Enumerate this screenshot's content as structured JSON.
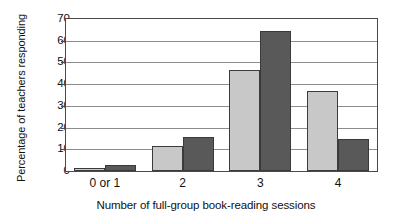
{
  "chart_data": {
    "type": "bar",
    "title": "",
    "xlabel": "Number of full-group book-reading sessions",
    "ylabel": "Percentage of teachers responding",
    "categories": [
      "0 or 1",
      "2",
      "3",
      "4"
    ],
    "series": [
      {
        "name": "series-1-light",
        "color": "#c8c8c8",
        "values": [
          1.5,
          11.5,
          46.5,
          37
        ]
      },
      {
        "name": "series-2-dark",
        "color": "#595959",
        "values": [
          3,
          15.5,
          64.5,
          14.8
        ]
      }
    ],
    "ylim": [
      0,
      70
    ],
    "yticks": [
      0,
      10,
      20,
      30,
      40,
      50,
      60,
      70
    ],
    "ytick_labels": [
      "0",
      "10",
      "20",
      "30",
      "40",
      "50",
      "60",
      "70"
    ],
    "grid": true,
    "grid_axis": "y",
    "legend": false,
    "legend_position": "none",
    "axis_color": "#4a4a4a",
    "gridline_color": "#8c8c8c",
    "background": "#ffffff"
  }
}
